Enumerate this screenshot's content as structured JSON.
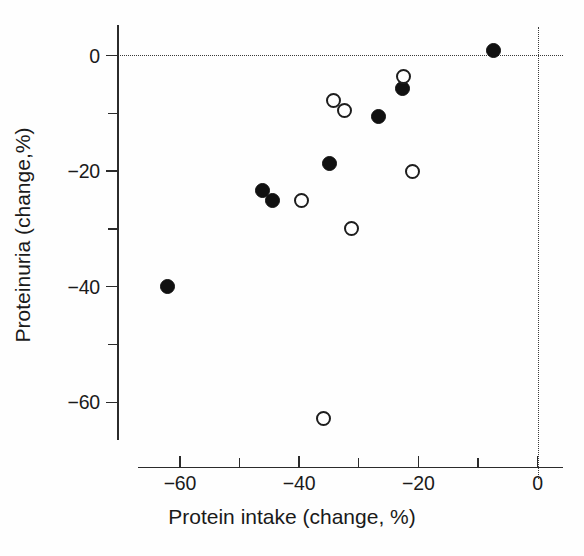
{
  "chart_data": {
    "type": "scatter",
    "title": "",
    "xlabel": "Protein intake (change, %)",
    "ylabel": "Proteinuria (change,%)",
    "xlim": [
      -70,
      4
    ],
    "ylim": [
      -71.5,
      4
    ],
    "grid": false,
    "legend": "none",
    "xticks": [
      {
        "value": -60,
        "label": "−60",
        "major": true
      },
      {
        "value": -50,
        "label": "",
        "major": false
      },
      {
        "value": -40,
        "label": "−40",
        "major": true
      },
      {
        "value": -30,
        "label": "",
        "major": false
      },
      {
        "value": -20,
        "label": "−20",
        "major": true
      },
      {
        "value": -10,
        "label": "",
        "major": false
      },
      {
        "value": 0,
        "label": "0",
        "major": true
      }
    ],
    "yticks": [
      {
        "value": 0,
        "label": "0",
        "major": true
      },
      {
        "value": -10,
        "label": "",
        "major": false
      },
      {
        "value": -20,
        "label": "−20",
        "major": true
      },
      {
        "value": -30,
        "label": "",
        "major": false
      },
      {
        "value": -40,
        "label": "−40",
        "major": true
      },
      {
        "value": -50,
        "label": "",
        "major": false
      },
      {
        "value": -60,
        "label": "−60",
        "major": true
      }
    ],
    "reference_lines": [
      {
        "orientation": "horizontal",
        "value": 0,
        "style": "dotted"
      },
      {
        "orientation": "vertical",
        "value": 0,
        "style": "dotted"
      }
    ],
    "series": [
      {
        "name": "filled",
        "marker": "filled-circle",
        "color": "#111111",
        "points": [
          {
            "x": -7.4,
            "y": 0.8
          },
          {
            "x": -22.6,
            "y": -5.7
          },
          {
            "x": -26.7,
            "y": -10.6
          },
          {
            "x": -34.9,
            "y": -18.6
          },
          {
            "x": -46.2,
            "y": -23.4
          },
          {
            "x": -44.5,
            "y": -25.0
          },
          {
            "x": -62.0,
            "y": -39.9
          }
        ]
      },
      {
        "name": "open",
        "marker": "open-circle",
        "color": "#1d1d1d",
        "points": [
          {
            "x": -22.5,
            "y": -3.6
          },
          {
            "x": -34.2,
            "y": -7.8
          },
          {
            "x": -32.4,
            "y": -9.5
          },
          {
            "x": -21.0,
            "y": -20.1
          },
          {
            "x": -39.6,
            "y": -25.0
          },
          {
            "x": -31.2,
            "y": -30.0
          },
          {
            "x": -35.9,
            "y": -62.8
          }
        ]
      }
    ]
  },
  "axis_titles": {
    "x": "Protein intake (change, %)",
    "y": "Proteinuria (change,%)"
  }
}
